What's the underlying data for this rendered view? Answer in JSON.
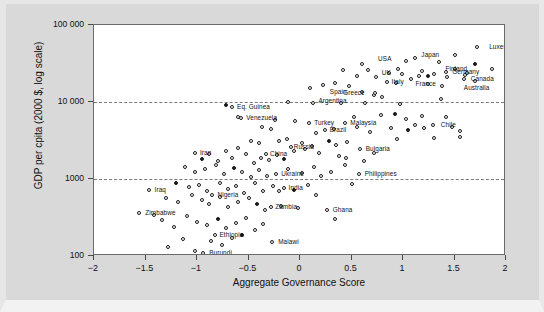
{
  "figure": {
    "background_color": "#d9d9d9",
    "plot_background_color": "#ffffff",
    "frame_color": "#6b6b6b",
    "point_color": "#1a1a1a",
    "gridline_color": "#7a7a7a"
  },
  "chart_data": {
    "type": "scatter",
    "title": "",
    "xlabel": "Aggregate Governance Score",
    "ylabel": "GDP per cpita (2000 $, log scale)",
    "xlim": [
      -2,
      2
    ],
    "ylim": [
      100,
      100000
    ],
    "yscale": "log",
    "xticks": [
      -2,
      -1.5,
      -1,
      -0.5,
      0,
      0.5,
      1,
      1.5,
      2
    ],
    "xtick_labels": [
      "−2",
      "−1.5",
      "−1",
      "−0.5",
      "0",
      "0.5",
      "1",
      "1.5",
      "2"
    ],
    "yticks": [
      100,
      1000,
      10000,
      100000
    ],
    "ytick_labels": [
      "100",
      "1000",
      "10 000",
      "100 000"
    ],
    "grid": "horizontal-dashed-at-1000-and-10000",
    "legend": null,
    "labeled_points": [
      {
        "label": "Luxembourg",
        "x": 1.72,
        "y": 52000,
        "lx": 12,
        "ly": 0
      },
      {
        "label": "Finland",
        "x": 1.86,
        "y": 27000,
        "lx": -46,
        "ly": 0
      },
      {
        "label": "Japan",
        "x": 1.12,
        "y": 37000,
        "lx": 6,
        "ly": -3
      },
      {
        "label": "USA",
        "x": 1.03,
        "y": 34000,
        "lx": -28,
        "ly": -2
      },
      {
        "label": "UK",
        "x": 0.95,
        "y": 27000,
        "lx": -16,
        "ly": 4
      },
      {
        "label": "Germany",
        "x": 1.42,
        "y": 24500,
        "lx": 6,
        "ly": 0
      },
      {
        "label": "Canada",
        "x": 1.6,
        "y": 22500,
        "lx": 6,
        "ly": 4
      },
      {
        "label": "Australia",
        "x": 1.59,
        "y": 20000,
        "lx": 0,
        "ly": 9
      },
      {
        "label": "France",
        "x": 1.16,
        "y": 22000,
        "lx": -4,
        "ly": 8
      },
      {
        "label": "Italy",
        "x": 0.84,
        "y": 18000,
        "lx": 5,
        "ly": 0
      },
      {
        "label": "Greece",
        "x": 0.73,
        "y": 13000,
        "lx": -32,
        "ly": 0
      },
      {
        "label": "Spain",
        "x": 0.6,
        "y": 13500,
        "lx": -32,
        "ly": 0
      },
      {
        "label": "Argentina",
        "x": 0.13,
        "y": 9600,
        "lx": 5,
        "ly": -2
      },
      {
        "label": "Chile",
        "x": 1.29,
        "y": 5100,
        "lx": 8,
        "ly": 0
      },
      {
        "label": "Eq. Guinea",
        "x": -0.66,
        "y": 8600,
        "lx": 5,
        "ly": 0
      },
      {
        "label": "Venezuela",
        "x": -0.57,
        "y": 6200,
        "lx": 5,
        "ly": 0
      },
      {
        "label": "Turkey",
        "x": 0.09,
        "y": 5300,
        "lx": 5,
        "ly": 0
      },
      {
        "label": "Malaysia",
        "x": 0.44,
        "y": 5300,
        "lx": 5,
        "ly": 0
      },
      {
        "label": "Brazil",
        "x": 0.24,
        "y": 4300,
        "lx": 5,
        "ly": 0
      },
      {
        "label": "Russia",
        "x": -0.09,
        "y": 2600,
        "lx": 3,
        "ly": 0
      },
      {
        "label": "China",
        "x": -0.33,
        "y": 2100,
        "lx": 4,
        "ly": 0
      },
      {
        "label": "Bulgaria",
        "x": 0.58,
        "y": 2450,
        "lx": 6,
        "ly": 0
      },
      {
        "label": "Iran",
        "x": -1.02,
        "y": 2200,
        "lx": 5,
        "ly": 0
      },
      {
        "label": "Ukraine",
        "x": -0.23,
        "y": 1150,
        "lx": 5,
        "ly": 0
      },
      {
        "label": "Philippines",
        "x": 0.57,
        "y": 1150,
        "lx": 6,
        "ly": 0
      },
      {
        "label": "India",
        "x": -0.16,
        "y": 760,
        "lx": 5,
        "ly": 0
      },
      {
        "label": "Nigeria",
        "x": -0.85,
        "y": 620,
        "lx": 5,
        "ly": 0
      },
      {
        "label": "Zambia",
        "x": -0.28,
        "y": 430,
        "lx": 4,
        "ly": 0
      },
      {
        "label": "Ghana",
        "x": 0.26,
        "y": 390,
        "lx": 6,
        "ly": 0
      },
      {
        "label": "Iraq",
        "x": -1.47,
        "y": 720,
        "lx": 6,
        "ly": 0
      },
      {
        "label": "Zimbabwe",
        "x": -1.56,
        "y": 360,
        "lx": 6,
        "ly": 0
      },
      {
        "label": "Ethiopia",
        "x": -0.83,
        "y": 190,
        "lx": 5,
        "ly": 0
      },
      {
        "label": "Burundi",
        "x": -0.94,
        "y": 108,
        "lx": 6,
        "ly": 0
      },
      {
        "label": "Malawi",
        "x": -0.27,
        "y": 150,
        "lx": 6,
        "ly": 0
      }
    ],
    "unlabeled_points": [
      {
        "x": -0.72,
        "y": 9100
      },
      {
        "x": -0.12,
        "y": 9900
      },
      {
        "x": 0.4,
        "y": 9800
      },
      {
        "x": 0.63,
        "y": 9700
      },
      {
        "x": 0.97,
        "y": 9400
      },
      {
        "x": 1.37,
        "y": 11000
      },
      {
        "x": -0.6,
        "y": 6400
      },
      {
        "x": -0.24,
        "y": 5900
      },
      {
        "x": -0.05,
        "y": 5700
      },
      {
        "x": 0.52,
        "y": 6400
      },
      {
        "x": 0.79,
        "y": 6700
      },
      {
        "x": 0.92,
        "y": 6900
      },
      {
        "x": 1.03,
        "y": 6100
      },
      {
        "x": 1.18,
        "y": 6600
      },
      {
        "x": 1.42,
        "y": 6300
      },
      {
        "x": -0.37,
        "y": 4700
      },
      {
        "x": -0.28,
        "y": 4500
      },
      {
        "x": 0.16,
        "y": 4000
      },
      {
        "x": 0.33,
        "y": 4400
      },
      {
        "x": 0.55,
        "y": 4800
      },
      {
        "x": 0.68,
        "y": 4100
      },
      {
        "x": 0.88,
        "y": 4600
      },
      {
        "x": 1.05,
        "y": 4300
      },
      {
        "x": 1.12,
        "y": 5100
      },
      {
        "x": 1.2,
        "y": 4600
      },
      {
        "x": 1.48,
        "y": 4800
      },
      {
        "x": 1.55,
        "y": 4200
      },
      {
        "x": -0.48,
        "y": 3100
      },
      {
        "x": -0.4,
        "y": 2900
      },
      {
        "x": -0.2,
        "y": 3100
      },
      {
        "x": -0.13,
        "y": 3300
      },
      {
        "x": 0.02,
        "y": 2900
      },
      {
        "x": 0.12,
        "y": 2700
      },
      {
        "x": 0.28,
        "y": 3100
      },
      {
        "x": 0.35,
        "y": 2800
      },
      {
        "x": 0.46,
        "y": 3000
      },
      {
        "x": 0.94,
        "y": 3300
      },
      {
        "x": 1.3,
        "y": 3400
      },
      {
        "x": 1.55,
        "y": 3500
      },
      {
        "x": 1.7,
        "y": 19000
      },
      {
        "x": 1.62,
        "y": 24000
      },
      {
        "x": 1.5,
        "y": 27000
      },
      {
        "x": 1.43,
        "y": 21000
      },
      {
        "x": 1.3,
        "y": 23000
      },
      {
        "x": 1.24,
        "y": 21500
      },
      {
        "x": 1.18,
        "y": 25000
      },
      {
        "x": 1.08,
        "y": 20000
      },
      {
        "x": 0.99,
        "y": 23000
      },
      {
        "x": 0.86,
        "y": 24000
      },
      {
        "x": 0.74,
        "y": 21000
      },
      {
        "x": 0.66,
        "y": 26000
      },
      {
        "x": 0.55,
        "y": 22000
      },
      {
        "x": 0.42,
        "y": 26000
      },
      {
        "x": 1.35,
        "y": 33000
      },
      {
        "x": 1.5,
        "y": 41000
      },
      {
        "x": 1.7,
        "y": 31000
      },
      {
        "x": 0.6,
        "y": 31000
      },
      {
        "x": 1.24,
        "y": 17000
      },
      {
        "x": 1.38,
        "y": 16000
      },
      {
        "x": 0.93,
        "y": 17500
      },
      {
        "x": 0.48,
        "y": 16000
      },
      {
        "x": 0.34,
        "y": 17500
      },
      {
        "x": 0.22,
        "y": 16500
      },
      {
        "x": 0.1,
        "y": 15000
      },
      {
        "x": 0.72,
        "y": 12500
      },
      {
        "x": 0.8,
        "y": 11500
      },
      {
        "x": -0.95,
        "y": 1800
      },
      {
        "x": -0.88,
        "y": 2100
      },
      {
        "x": -0.8,
        "y": 1700
      },
      {
        "x": -0.72,
        "y": 2300
      },
      {
        "x": -0.66,
        "y": 1900
      },
      {
        "x": -0.6,
        "y": 2500
      },
      {
        "x": -0.52,
        "y": 2100
      },
      {
        "x": -0.45,
        "y": 1600
      },
      {
        "x": -0.38,
        "y": 1900
      },
      {
        "x": -0.3,
        "y": 1750
      },
      {
        "x": -0.22,
        "y": 2050
      },
      {
        "x": -0.16,
        "y": 1800
      },
      {
        "x": -0.06,
        "y": 2300
      },
      {
        "x": 0.05,
        "y": 2450
      },
      {
        "x": 0.18,
        "y": 2200
      },
      {
        "x": 0.38,
        "y": 2000
      },
      {
        "x": 0.72,
        "y": 2150
      },
      {
        "x": -1.12,
        "y": 1450
      },
      {
        "x": -1.02,
        "y": 1250
      },
      {
        "x": -0.92,
        "y": 1350
      },
      {
        "x": -0.82,
        "y": 1500
      },
      {
        "x": -0.74,
        "y": 1150
      },
      {
        "x": -0.64,
        "y": 1400
      },
      {
        "x": -0.56,
        "y": 1250
      },
      {
        "x": -0.48,
        "y": 1050
      },
      {
        "x": -0.4,
        "y": 1300
      },
      {
        "x": -0.32,
        "y": 1100
      },
      {
        "x": -0.12,
        "y": 1350
      },
      {
        "x": 0.02,
        "y": 1200
      },
      {
        "x": 0.14,
        "y": 1450
      },
      {
        "x": 0.3,
        "y": 1250
      },
      {
        "x": 0.44,
        "y": 1500
      },
      {
        "x": 0.2,
        "y": 1100
      },
      {
        "x": -1.2,
        "y": 900
      },
      {
        "x": -1.08,
        "y": 780
      },
      {
        "x": -0.98,
        "y": 840
      },
      {
        "x": -0.9,
        "y": 700
      },
      {
        "x": -0.78,
        "y": 880
      },
      {
        "x": -0.7,
        "y": 740
      },
      {
        "x": -0.62,
        "y": 820
      },
      {
        "x": -0.54,
        "y": 650
      },
      {
        "x": -0.44,
        "y": 900
      },
      {
        "x": -0.36,
        "y": 700
      },
      {
        "x": -0.26,
        "y": 820
      },
      {
        "x": -0.06,
        "y": 720
      },
      {
        "x": 0.08,
        "y": 840
      },
      {
        "x": -1.3,
        "y": 560
      },
      {
        "x": -1.18,
        "y": 500
      },
      {
        "x": -1.05,
        "y": 620
      },
      {
        "x": -0.95,
        "y": 540
      },
      {
        "x": -0.88,
        "y": 470
      },
      {
        "x": -0.78,
        "y": 590
      },
      {
        "x": -0.7,
        "y": 430
      },
      {
        "x": -0.6,
        "y": 510
      },
      {
        "x": -0.5,
        "y": 560
      },
      {
        "x": -0.42,
        "y": 470
      },
      {
        "x": -0.34,
        "y": 390
      },
      {
        "x": -0.18,
        "y": 450
      },
      {
        "x": -0.02,
        "y": 420
      },
      {
        "x": 0.34,
        "y": 300
      },
      {
        "x": -1.42,
        "y": 340
      },
      {
        "x": -1.34,
        "y": 290
      },
      {
        "x": -1.22,
        "y": 240
      },
      {
        "x": -1.1,
        "y": 330
      },
      {
        "x": -1.0,
        "y": 280
      },
      {
        "x": -0.9,
        "y": 250
      },
      {
        "x": -0.8,
        "y": 300
      },
      {
        "x": -0.72,
        "y": 230
      },
      {
        "x": -0.62,
        "y": 270
      },
      {
        "x": -0.52,
        "y": 310
      },
      {
        "x": -0.44,
        "y": 220
      },
      {
        "x": -0.36,
        "y": 260
      },
      {
        "x": -1.28,
        "y": 130
      },
      {
        "x": -1.14,
        "y": 165
      },
      {
        "x": -0.86,
        "y": 155
      },
      {
        "x": -0.76,
        "y": 140
      },
      {
        "x": -0.66,
        "y": 170
      },
      {
        "x": -0.56,
        "y": 185
      },
      {
        "x": -1.02,
        "y": 115
      },
      {
        "x": 0.45,
        "y": 1900
      },
      {
        "x": 0.62,
        "y": 1700
      },
      {
        "x": -0.2,
        "y": 700
      },
      {
        "x": 0.5,
        "y": 870
      },
      {
        "x": 0.16,
        "y": 620
      }
    ]
  }
}
